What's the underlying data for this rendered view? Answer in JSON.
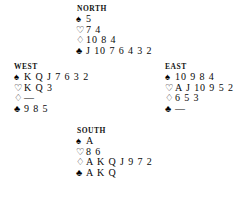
{
  "diagram": {
    "type": "bridge-deal-diagram",
    "suit_symbols": {
      "spades": "♠",
      "hearts": "♡",
      "diamonds": "♢",
      "clubs": "♣"
    },
    "void_marker": "—",
    "hands": {
      "north": {
        "label": "NORTH",
        "spades": "5",
        "hearts": "7 4",
        "diamonds": "10 8 4",
        "clubs": "J 10 7 6 4 3 2"
      },
      "west": {
        "label": "WEST",
        "spades": "K Q J 7 6 3 2",
        "hearts": "K Q 3",
        "diamonds": "—",
        "clubs": "9 8 5"
      },
      "east": {
        "label": "EAST",
        "spades": "10 9 8 4",
        "hearts": "A J 10 9 5 2",
        "diamonds": "6 5 3",
        "clubs": "—"
      },
      "south": {
        "label": "SOUTH",
        "spades": "A",
        "hearts": "8 6",
        "diamonds": "A K Q J 9 7 2",
        "clubs": "A K Q"
      }
    }
  }
}
